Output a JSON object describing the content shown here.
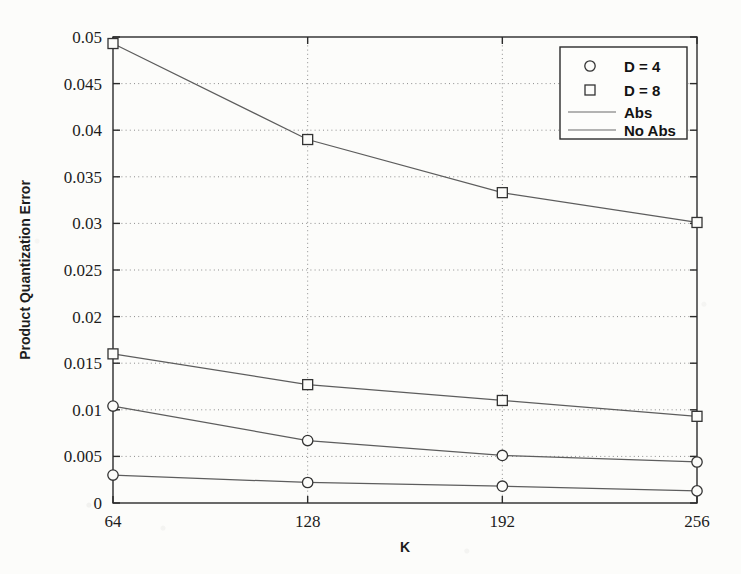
{
  "chart_data": {
    "type": "line",
    "title": "",
    "xlabel": "K",
    "ylabel": "Product Quantization Error",
    "x": [
      64,
      128,
      192,
      256
    ],
    "xtick_labels": [
      "64",
      "128",
      "192",
      "256"
    ],
    "xlim": [
      64,
      256
    ],
    "ylim": [
      0,
      0.05
    ],
    "ytick_labels": [
      "0",
      "0.005",
      "0.01",
      "0.015",
      "0.02",
      "0.025",
      "0.03",
      "0.035",
      "0.04",
      "0.045",
      "0.05"
    ],
    "ytick_values": [
      0,
      0.005,
      0.01,
      0.015,
      0.02,
      0.025,
      0.03,
      0.035,
      0.04,
      0.045,
      0.05
    ],
    "grid": true,
    "legend_position": "upper right",
    "series": [
      {
        "name": "D = 8, No Abs",
        "marker": "square",
        "values": [
          0.0493,
          0.039,
          0.0333,
          0.0301
        ]
      },
      {
        "name": "D = 8, Abs",
        "marker": "square",
        "values": [
          0.016,
          0.0127,
          0.011,
          0.0093
        ]
      },
      {
        "name": "D = 4, No Abs",
        "marker": "circle",
        "values": [
          0.0104,
          0.0067,
          0.0051,
          0.0044
        ]
      },
      {
        "name": "D = 4, Abs",
        "marker": "circle",
        "values": [
          0.003,
          0.0022,
          0.0018,
          0.0013
        ]
      }
    ],
    "legend": [
      {
        "label": "D = 4",
        "symbol": "circle"
      },
      {
        "label": "D = 8",
        "symbol": "square"
      },
      {
        "label": "Abs",
        "symbol": "line"
      },
      {
        "label": "No Abs",
        "symbol": "line"
      }
    ],
    "colors": {
      "line": "#5d5d5d",
      "axis": "#2b2b2b",
      "grid": "#8d8d8d",
      "background": "#fcfcfa",
      "text": "#1d1d1d"
    }
  }
}
